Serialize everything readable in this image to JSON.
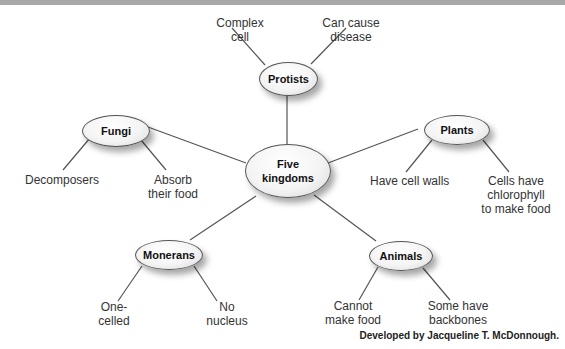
{
  "diagram": {
    "center": {
      "label_line1": "Five",
      "label_line2": "kingdoms"
    },
    "kingdoms": {
      "protists": {
        "label": "Protists",
        "traits": [
          {
            "line1": "Complex",
            "line2": "cell"
          },
          {
            "line1": "Can cause",
            "line2": "disease"
          }
        ]
      },
      "fungi": {
        "label": "Fungi",
        "traits": [
          {
            "line1": "Decomposers",
            "line2": ""
          },
          {
            "line1": "Absorb",
            "line2": "their food"
          }
        ]
      },
      "plants": {
        "label": "Plants",
        "traits": [
          {
            "line1": "Have cell walls",
            "line2": ""
          },
          {
            "line1": "Cells have",
            "line2": "chlorophyll",
            "line3": "to make food"
          }
        ]
      },
      "monerans": {
        "label": "Monerans",
        "traits": [
          {
            "line1": "One-",
            "line2": "celled"
          },
          {
            "line1": "No",
            "line2": "nucleus"
          }
        ]
      },
      "animals": {
        "label": "Animals",
        "traits": [
          {
            "line1": "Cannot",
            "line2": "make food"
          },
          {
            "line1": "Some have",
            "line2": "backbones"
          }
        ]
      }
    },
    "credit": "Developed by Jacqueline T. McDonnough.",
    "colors": {
      "line": "#555555",
      "node_fill": "#f4f4f4",
      "top_bar": "#a8a8a8"
    }
  }
}
